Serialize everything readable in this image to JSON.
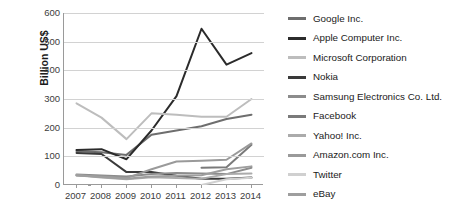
{
  "chart_data": {
    "type": "line",
    "title": "",
    "xlabel": "",
    "ylabel": "Billion US$",
    "categories": [
      "2007",
      "2008",
      "2009",
      "2010",
      "2011",
      "2012",
      "2013",
      "2014"
    ],
    "x": [
      2007,
      2008,
      2009,
      2010,
      2011,
      2012,
      2013,
      2014
    ],
    "ylim": [
      0,
      600
    ],
    "yticks": [
      0,
      100,
      200,
      300,
      400,
      500,
      600
    ],
    "grid": true,
    "legend_position": "right",
    "series": [
      {
        "name": "Google Inc.",
        "color": "#6e6e6e",
        "values": [
          118,
          114,
          105,
          175,
          190,
          205,
          230,
          245
        ]
      },
      {
        "name": "Apple Computer Inc.",
        "color": "#2b2b2b",
        "values": [
          122,
          125,
          90,
          190,
          310,
          545,
          420,
          460
        ]
      },
      {
        "name": "Microsoft Corporation",
        "color": "#bdbdbd",
        "values": [
          285,
          235,
          160,
          250,
          245,
          238,
          238,
          300
        ]
      },
      {
        "name": "Nokia",
        "color": "#3a3a3a",
        "values": [
          112,
          108,
          45,
          45,
          32,
          22,
          22,
          26
        ]
      },
      {
        "name": "Samsung Electronics Co. Ltd.",
        "color": "#8c8c8c",
        "values": [
          37,
          33,
          30,
          38,
          42,
          40,
          38,
          60
        ]
      },
      {
        "name": "Facebook",
        "color": "#7a7a7a",
        "values": [
          0,
          0,
          0,
          0,
          0,
          60,
          62,
          140
        ]
      },
      {
        "name": "Yahoo! Inc.",
        "color": "#ababab",
        "values": [
          34,
          26,
          20,
          27,
          24,
          22,
          38,
          40
        ]
      },
      {
        "name": "Amazon.com Inc.",
        "color": "#9a9a9a",
        "values": [
          33,
          30,
          24,
          55,
          82,
          85,
          88,
          145
        ]
      },
      {
        "name": "Twitter",
        "color": "#d0d0d0",
        "values": [
          0,
          0,
          0,
          0,
          0,
          0,
          20,
          25
        ]
      },
      {
        "name": "eBay",
        "color": "#9e9e9e",
        "values": [
          34,
          28,
          22,
          30,
          32,
          34,
          55,
          65
        ]
      }
    ]
  },
  "axis": {
    "y_title": "Billion US$",
    "y_ticks": [
      "600",
      "500",
      "400",
      "300",
      "200",
      "100",
      "0"
    ],
    "x_ticks": [
      "2007",
      "2008",
      "2009",
      "2010",
      "2011",
      "2012",
      "2013",
      "2014"
    ]
  },
  "legend": {
    "items": [
      {
        "label": "Google Inc."
      },
      {
        "label": "Apple Computer Inc."
      },
      {
        "label": "Microsoft Corporation"
      },
      {
        "label": "Nokia"
      },
      {
        "label": "Samsung Electronics Co. Ltd."
      },
      {
        "label": "Facebook"
      },
      {
        "label": "Yahoo! Inc."
      },
      {
        "label": "Amazon.com Inc."
      },
      {
        "label": "Twitter"
      },
      {
        "label": "eBay"
      }
    ]
  }
}
